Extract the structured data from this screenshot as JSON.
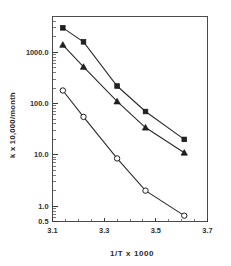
{
  "chart_data": {
    "type": "line",
    "title": "",
    "subtitle": "",
    "xlabel": "1/T  x  1000",
    "ylabel": "k  x  10,000/month",
    "xscale": "linear",
    "yscale": "log",
    "xlim": [
      3.1,
      3.7
    ],
    "ylim": [
      0.5,
      5000
    ],
    "grid": false,
    "legend": "none",
    "xticks": [
      "3.1",
      "3.3",
      "3.5",
      "3.7"
    ],
    "xtick_values": [
      3.1,
      3.3,
      3.5,
      3.7
    ],
    "yticks": [
      "1000.0",
      "100.0",
      "10.0",
      "1.0",
      "0.5"
    ],
    "ytick_values": [
      1000.0,
      100.0,
      10.0,
      1.0,
      0.5
    ],
    "x": [
      3.14,
      3.22,
      3.35,
      3.46,
      3.61
    ],
    "series": [
      {
        "name": "series-1",
        "marker": "filled-square",
        "values": [
          3000,
          1600,
          220,
          70,
          20
        ]
      },
      {
        "name": "series-2",
        "marker": "triangle",
        "values": [
          1400,
          520,
          110,
          34,
          11
        ]
      },
      {
        "name": "series-3",
        "marker": "open-circle",
        "values": [
          180,
          55,
          8.5,
          2.0,
          0.65
        ]
      }
    ]
  },
  "axis_labels": {
    "y_axis_title": "k  x  10,000/month",
    "x_axis_title": "1/T  x  1000"
  },
  "colors": {
    "line": "#2b2b2b",
    "marker_fill": "#222222",
    "marker_open_fill": "#ffffff",
    "axis": "#4a4a4a",
    "text": "#2a2a2a",
    "background": "#ffffff"
  }
}
